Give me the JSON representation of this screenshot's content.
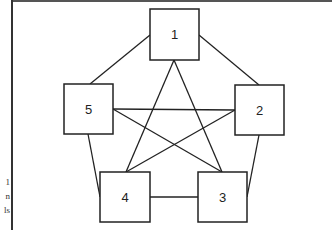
{
  "diagram": {
    "type": "complete-graph",
    "stroke_color": "#222222",
    "nodes": [
      {
        "id": "1",
        "label": "1",
        "x": 150,
        "y": 9,
        "w": 49,
        "h": 51
      },
      {
        "id": "2",
        "label": "2",
        "x": 235,
        "y": 85,
        "w": 49,
        "h": 50
      },
      {
        "id": "3",
        "label": "3",
        "x": 198,
        "y": 172,
        "w": 49,
        "h": 50
      },
      {
        "id": "4",
        "label": "4",
        "x": 100,
        "y": 172,
        "w": 50,
        "h": 50
      },
      {
        "id": "5",
        "label": "5",
        "x": 64,
        "y": 84,
        "w": 49,
        "h": 50
      }
    ],
    "edges": [
      {
        "from": "1",
        "to": "2"
      },
      {
        "from": "1",
        "to": "5"
      },
      {
        "from": "1",
        "to": "3"
      },
      {
        "from": "1",
        "to": "4"
      },
      {
        "from": "2",
        "to": "3"
      },
      {
        "from": "2",
        "to": "4"
      },
      {
        "from": "2",
        "to": "5"
      },
      {
        "from": "3",
        "to": "4"
      },
      {
        "from": "3",
        "to": "5"
      },
      {
        "from": "4",
        "to": "5"
      }
    ]
  },
  "margin_text": {
    "line1": "1",
    "line2": "n",
    "line3": "ls"
  }
}
